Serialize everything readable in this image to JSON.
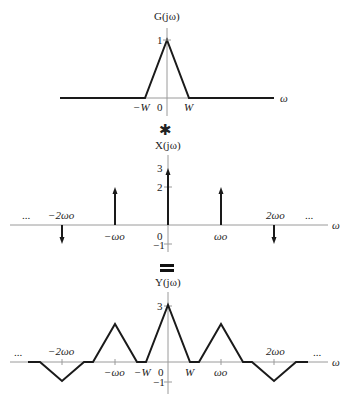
{
  "panels": [
    {
      "id": "g",
      "title": "G(jω)",
      "xlabel": "ω",
      "ylabels": [
        {
          "value": 1,
          "text": "1"
        }
      ],
      "xlabels": [
        {
          "x": "-W",
          "text": "−W"
        },
        {
          "x": "0",
          "text": "0"
        },
        {
          "x": "W",
          "text": "W"
        }
      ],
      "description": "Triangle pulse of height 1 spanning −W to W"
    },
    {
      "id": "x",
      "title": "X(jω)",
      "xlabel": "ω",
      "ylabels": [
        {
          "value": 3,
          "text": "3"
        },
        {
          "value": 2,
          "text": "2"
        },
        {
          "value": 0,
          "text": "0"
        },
        {
          "value": -1,
          "text": "−1"
        }
      ],
      "xlabels": [
        {
          "x": "-2ωo",
          "text": "−2ωo"
        },
        {
          "x": "-ωo",
          "text": "−ωo"
        },
        {
          "x": "ωo",
          "text": "ωo"
        },
        {
          "x": "2ωo",
          "text": "2ωo"
        }
      ],
      "ellipsis": "...",
      "impulses": [
        {
          "at": "-2ωo",
          "value": -1
        },
        {
          "at": "-ωo",
          "value": 2
        },
        {
          "at": "0",
          "value": 3
        },
        {
          "at": "ωo",
          "value": 2
        },
        {
          "at": "2ωo",
          "value": -1
        }
      ]
    },
    {
      "id": "y",
      "title": "Y(jω)",
      "xlabel": "ω",
      "ylabels": [
        {
          "value": 3,
          "text": "3"
        },
        {
          "value": 0,
          "text": "0"
        },
        {
          "value": -1,
          "text": "−1"
        }
      ],
      "xlabels": [
        {
          "x": "-2ωo",
          "text": "−2ωo"
        },
        {
          "x": "-ωo",
          "text": "−ωo"
        },
        {
          "x": "-W",
          "text": "−W"
        },
        {
          "x": "W",
          "text": "W"
        },
        {
          "x": "ωo",
          "text": "ωo"
        },
        {
          "x": "2ωo",
          "text": "2ωo"
        }
      ],
      "ellipsis": "...",
      "triangles": [
        {
          "center": "-2ωo",
          "height": -1
        },
        {
          "center": "-ωo",
          "height": 2
        },
        {
          "center": "0",
          "height": 3
        },
        {
          "center": "ωo",
          "height": 2
        },
        {
          "center": "2ωo",
          "height": -1
        }
      ]
    }
  ],
  "operators": {
    "convolve": "✱",
    "equals": "="
  },
  "model": {
    "omega_o_units": 1,
    "W_units": 0.415
  }
}
